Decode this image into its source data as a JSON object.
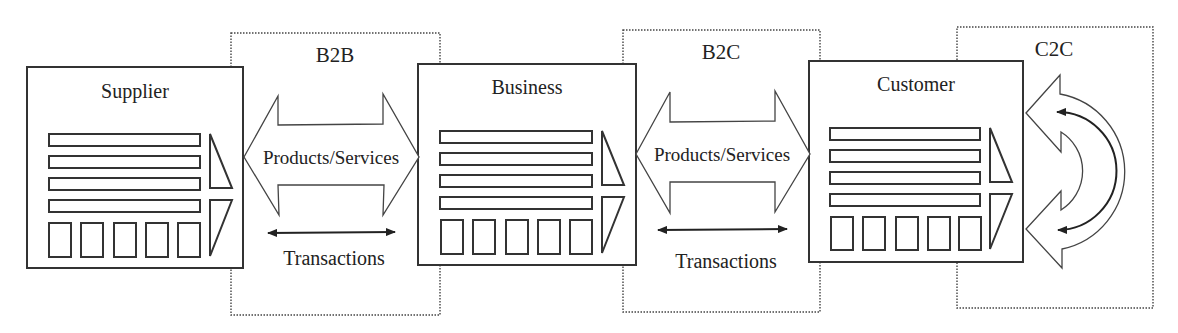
{
  "diagram": {
    "entities": [
      {
        "id": "supplier",
        "label": "Supplier"
      },
      {
        "id": "business",
        "label": "Business"
      },
      {
        "id": "customer",
        "label": "Customer"
      }
    ],
    "relations": [
      {
        "id": "b2b",
        "label": "B2B",
        "flow_label": "Products/Services",
        "transaction_label": "Transactions"
      },
      {
        "id": "b2c",
        "label": "B2C",
        "flow_label": "Products/Services",
        "transaction_label": "Transactions"
      },
      {
        "id": "c2c",
        "label": "C2C"
      }
    ],
    "colors": {
      "stroke": "#333333",
      "background": "#ffffff",
      "text": "#222222"
    }
  }
}
